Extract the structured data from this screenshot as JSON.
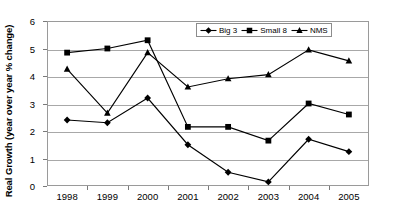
{
  "chart_data": {
    "type": "line",
    "title": "",
    "xlabel": "",
    "ylabel": "Real Growth (year over year % change)",
    "categories": [
      "1998",
      "1999",
      "2000",
      "2001",
      "2002",
      "2003",
      "2004",
      "2005"
    ],
    "x": [
      1998,
      1999,
      2000,
      2001,
      2002,
      2003,
      2004,
      2005
    ],
    "ylim": [
      0,
      6
    ],
    "yticks": [
      0,
      1,
      2,
      3,
      4,
      5,
      6
    ],
    "grid": true,
    "legend_position": "top-center",
    "series": [
      {
        "name": "Big 3",
        "marker": "diamond",
        "color": "#000000",
        "values": [
          2.4,
          2.3,
          3.2,
          1.5,
          0.5,
          0.15,
          1.7,
          1.25
        ]
      },
      {
        "name": "Small 8",
        "marker": "square",
        "color": "#000000",
        "values": [
          4.85,
          5.0,
          5.3,
          2.15,
          2.15,
          1.65,
          3.0,
          2.6
        ]
      },
      {
        "name": "NMS",
        "marker": "triangle",
        "color": "#000000",
        "values": [
          4.25,
          2.65,
          4.85,
          3.6,
          3.9,
          4.05,
          4.95,
          4.55
        ]
      }
    ]
  },
  "axis": {
    "y_tick_labels": [
      "0",
      "1",
      "2",
      "3",
      "4",
      "5",
      "6"
    ],
    "x_tick_labels": [
      "1998",
      "1999",
      "2000",
      "2001",
      "2002",
      "2003",
      "2004",
      "2005"
    ],
    "y_title": "Real Growth (year over year % change)"
  },
  "legend": {
    "entries": [
      {
        "label": "Big 3",
        "marker": "diamond"
      },
      {
        "label": "Small 8",
        "marker": "square"
      },
      {
        "label": "NMS",
        "marker": "triangle"
      }
    ]
  }
}
